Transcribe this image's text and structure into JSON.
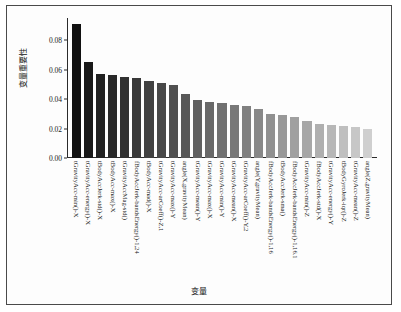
{
  "chart_data": {
    "type": "bar",
    "title": "",
    "xlabel": "变量",
    "ylabel": "变量重要性",
    "ylim": [
      0.0,
      0.095
    ],
    "yticks": [
      "0.00",
      "0.02",
      "0.04",
      "0.06",
      "0.08"
    ],
    "ytick_values": [
      0.0,
      0.02,
      0.04,
      0.06,
      0.08
    ],
    "grid": false,
    "legend": null,
    "orientation": "vertical",
    "bar_color_start": "#111111",
    "bar_color_end": "#cfcfcf",
    "categories": [
      "tGravityAcc-min()-X",
      "tGravityAcc-energy()-X",
      "tBodyAccJerk-std()-X",
      "tBodyAcc-max()-X",
      "tGravityAccMag-std()",
      "fBodyAccJerk-bandsEnergy()-1,24",
      "tBodyAcc-mad()-X",
      "tGravityAcc-arCoeff()-Z,1",
      "tGravityAcc-max()-Y",
      "angle(X,gravityMean)",
      "tGravityAcc-mean()-Y",
      "tGravityAcc-max()-X",
      "tGravityAcc-min()-Y",
      "tGravityAcc-mean()-X",
      "tGravityAcc-arCoeff()-Y,2",
      "angle(Y,gravityMean)",
      "fBodyAccJerk-bandsEnergy()-1,16",
      "tBodyAccJerk-sma()",
      "fBodyAccJerk-bandsEnergy()-1,16.1",
      "tGravityAcc-min()-Z",
      "fBodyAccJerk-std()-X",
      "tGravityAcc-energy()-Y",
      "tBodyGyroJerk-iqr()-Z",
      "tGravityAcc-mean()-Z",
      "angle(Z,gravityMean)"
    ],
    "values": [
      0.091,
      0.0652,
      0.057,
      0.0562,
      0.055,
      0.0546,
      0.0522,
      0.0506,
      0.0495,
      0.0437,
      0.0392,
      0.038,
      0.037,
      0.0362,
      0.0356,
      0.033,
      0.03,
      0.0292,
      0.0276,
      0.0248,
      0.0232,
      0.0222,
      0.0216,
      0.0208,
      0.0194
    ]
  }
}
